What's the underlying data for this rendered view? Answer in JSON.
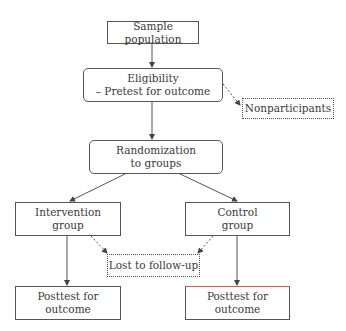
{
  "diagram": {
    "type": "flowchart",
    "nodes": [
      {
        "id": "sample",
        "lines": [
          "Sample population"
        ],
        "style": "solid"
      },
      {
        "id": "eligibility",
        "lines": [
          "Eligibility",
          "– Pretest for outcome"
        ],
        "style": "rounded"
      },
      {
        "id": "nonparticipants",
        "lines": [
          "Nonparticipants"
        ],
        "style": "dotted"
      },
      {
        "id": "randomization",
        "lines": [
          "Randomization",
          "to groups"
        ],
        "style": "rounded"
      },
      {
        "id": "intervention",
        "lines": [
          "Intervention",
          "group"
        ],
        "style": "solid"
      },
      {
        "id": "control",
        "lines": [
          "Control",
          "group"
        ],
        "style": "solid"
      },
      {
        "id": "lost",
        "lines": [
          "Lost to follow-up"
        ],
        "style": "dotted"
      },
      {
        "id": "posttest_intervention",
        "lines": [
          "Posttest for",
          "outcome"
        ],
        "style": "solid"
      },
      {
        "id": "posttest_control",
        "lines": [
          "Posttest for",
          "outcome"
        ],
        "style": "solid"
      }
    ],
    "edges": [
      {
        "from": "sample",
        "to": "eligibility",
        "style": "solid"
      },
      {
        "from": "eligibility",
        "to": "nonparticipants",
        "style": "dashed"
      },
      {
        "from": "eligibility",
        "to": "randomization",
        "style": "solid"
      },
      {
        "from": "randomization",
        "to": "intervention",
        "style": "solid"
      },
      {
        "from": "randomization",
        "to": "control",
        "style": "solid"
      },
      {
        "from": "intervention",
        "to": "lost",
        "style": "dashed"
      },
      {
        "from": "control",
        "to": "lost",
        "style": "dashed"
      },
      {
        "from": "intervention",
        "to": "posttest_intervention",
        "style": "solid"
      },
      {
        "from": "control",
        "to": "posttest_control",
        "style": "solid"
      }
    ]
  },
  "colors": {
    "line": "#555555",
    "text": "#3a3a3a",
    "artifact_top_edge": "#e05a5a"
  }
}
